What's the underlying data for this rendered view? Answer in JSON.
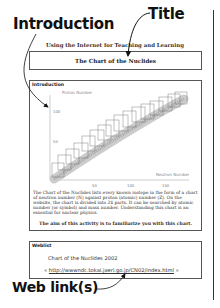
{
  "callouts": {
    "title": "Title",
    "introduction": "Introduction",
    "web_links": "Web link(s)"
  },
  "page": {
    "subtitle": "Using the Internet for Teaching and Learning",
    "title": "The Chart of the Nuclides"
  },
  "introduction": {
    "heading": "Introduction",
    "chart": {
      "y_label": "Proton Number",
      "x_label": "Neutron Number",
      "y_ticks": [
        "50",
        "100"
      ],
      "x_ticks": [
        "50",
        "100",
        "150"
      ]
    },
    "body": "The Chart of the Nuclides lists every known isotope in the form of a chart of neutron number (N) against proton (atomic) number (Z). On the website, the chart is divided into 24 parts. It can be searched by atomic number (or symbol) and mass number. Understanding this chart is an essential for nuclear physics.",
    "aim": "The aim of this activity is to familiarize you with this chart."
  },
  "weblist": {
    "heading": "Weblist",
    "items": [
      {
        "name": "Chart of the Nuclides 2002",
        "prefix": "«",
        "url": "http://wwwndc.tokai.jaeri.go.jp/CN02/index.html",
        "suffix": "»"
      }
    ]
  }
}
